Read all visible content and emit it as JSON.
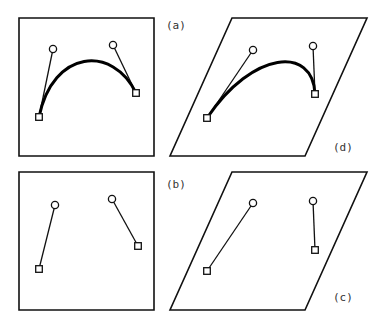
{
  "figure": {
    "panels": [
      {
        "id": "a",
        "label": "(a)",
        "shape": "square",
        "frame": [
          [
            19,
            18
          ],
          [
            154,
            18
          ],
          [
            154,
            156
          ],
          [
            19,
            156
          ]
        ],
        "anchors": [
          [
            39,
            117
          ],
          [
            136,
            93
          ]
        ],
        "controls": [
          [
            53,
            49
          ],
          [
            113,
            45
          ]
        ],
        "curve": true,
        "label_pos": [
          166,
          29
        ]
      },
      {
        "id": "d",
        "label": "(d)",
        "shape": "parallelogram",
        "frame": [
          [
            232,
            18
          ],
          [
            367,
            18
          ],
          [
            305,
            156
          ],
          [
            170,
            156
          ]
        ],
        "anchors": [
          [
            207,
            118
          ],
          [
            315,
            94
          ]
        ],
        "controls": [
          [
            253,
            50
          ],
          [
            313,
            46
          ]
        ],
        "curve": true,
        "label_pos": [
          333,
          151
        ]
      },
      {
        "id": "b",
        "label": "(b)",
        "shape": "square",
        "frame": [
          [
            19,
            172
          ],
          [
            154,
            172
          ],
          [
            154,
            310
          ],
          [
            19,
            310
          ]
        ],
        "anchors": [
          [
            39,
            269
          ],
          [
            138,
            246
          ]
        ],
        "controls": [
          [
            55,
            205
          ],
          [
            112,
            199
          ]
        ],
        "curve": false,
        "label_pos": [
          166,
          188
        ]
      },
      {
        "id": "c",
        "label": "(c)",
        "shape": "parallelogram",
        "frame": [
          [
            232,
            172
          ],
          [
            367,
            172
          ],
          [
            305,
            310
          ],
          [
            170,
            310
          ]
        ],
        "anchors": [
          [
            207,
            271
          ],
          [
            315,
            250
          ]
        ],
        "controls": [
          [
            253,
            203
          ],
          [
            313,
            201
          ]
        ],
        "curve": false,
        "label_pos": [
          333,
          301
        ]
      }
    ],
    "legend": {
      "anchor_symbol": "square",
      "control_symbol": "circle"
    }
  }
}
